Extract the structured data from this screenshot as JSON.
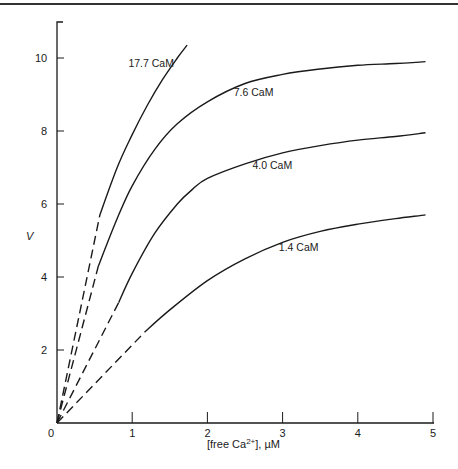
{
  "chart_data": {
    "type": "line",
    "title": "",
    "xlabel": "[free Ca2+], µM",
    "xlabel_parts": {
      "pre": "[free Ca",
      "sup": "2+",
      "post": "], µM"
    },
    "ylabel": "V",
    "xlim": [
      0,
      5
    ],
    "ylim": [
      0,
      11
    ],
    "x_ticks": [
      0,
      1,
      2,
      3,
      4,
      5
    ],
    "y_ticks": [
      2,
      4,
      6,
      8,
      10
    ],
    "x_tick_labels": [
      "0",
      "1",
      "2",
      "3",
      "4",
      "5"
    ],
    "y_tick_labels": [
      "2",
      "4",
      "6",
      "8",
      "10"
    ],
    "grid": false,
    "legend": "inline labels",
    "series": [
      {
        "name": "17.7 CaM",
        "dashed_segment": {
          "x": [
            0,
            0.57
          ],
          "y": [
            0,
            5.7
          ]
        },
        "x": [
          0.57,
          0.8,
          1.0,
          1.2,
          1.4,
          1.6,
          1.73
        ],
        "y": [
          5.7,
          7.0,
          7.9,
          8.7,
          9.4,
          10.0,
          10.35
        ],
        "label_pos": {
          "x": 0.95,
          "y": 9.75
        }
      },
      {
        "name": "7.6 CaM",
        "dashed_segment": {
          "x": [
            0,
            0.55
          ],
          "y": [
            0,
            4.3
          ]
        },
        "x": [
          0.55,
          0.8,
          1.0,
          1.3,
          1.6,
          2.0,
          2.5,
          3.0,
          3.5,
          4.0,
          4.5,
          4.9
        ],
        "y": [
          4.3,
          5.6,
          6.5,
          7.5,
          8.2,
          8.8,
          9.3,
          9.55,
          9.7,
          9.8,
          9.85,
          9.9
        ],
        "label_pos": {
          "x": 2.35,
          "y": 8.95
        }
      },
      {
        "name": "4.0 CaM",
        "dashed_segment": {
          "x": [
            0,
            0.82
          ],
          "y": [
            0,
            3.3
          ]
        },
        "x": [
          0.82,
          1.0,
          1.3,
          1.6,
          1.8,
          2.0,
          2.5,
          3.0,
          3.5,
          4.0,
          4.5,
          4.9
        ],
        "y": [
          3.3,
          4.1,
          5.2,
          6.0,
          6.4,
          6.7,
          7.1,
          7.4,
          7.6,
          7.75,
          7.85,
          7.95
        ],
        "label_pos": {
          "x": 2.6,
          "y": 6.95
        }
      },
      {
        "name": "1.4 CaM",
        "dashed_segment": {
          "x": [
            0,
            1.17
          ],
          "y": [
            0,
            2.5
          ]
        },
        "x": [
          1.17,
          1.5,
          2.0,
          2.5,
          3.0,
          3.5,
          4.0,
          4.5,
          4.9
        ],
        "y": [
          2.5,
          3.1,
          3.9,
          4.5,
          4.95,
          5.25,
          5.45,
          5.6,
          5.7
        ],
        "label_pos": {
          "x": 2.95,
          "y": 4.7
        }
      }
    ]
  }
}
